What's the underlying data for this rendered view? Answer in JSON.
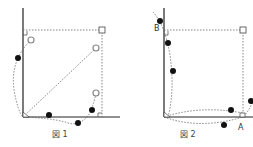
{
  "figures": [
    {
      "caption": "図 1",
      "labels": []
    },
    {
      "caption": "図 2",
      "labels": [
        "B",
        "A"
      ]
    }
  ],
  "colors": {
    "line": "#222222",
    "dotted": "#666666",
    "dot": "#111111",
    "open": "#888888"
  }
}
